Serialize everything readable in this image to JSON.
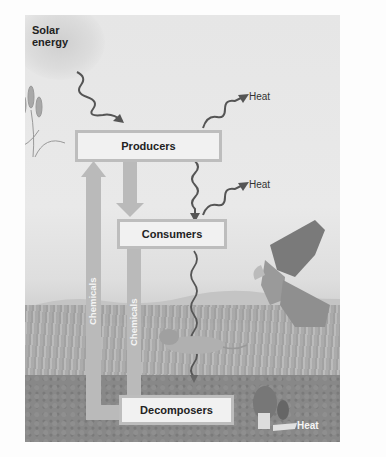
{
  "diagram": {
    "type": "ecosystem energy flow and chemical cycling",
    "labels": {
      "solar_energy": "Solar\nenergy",
      "solar_line1": "Solar",
      "solar_line2": "energy",
      "heat_top": "Heat",
      "heat_middle": "Heat",
      "heat_bottom": "Heat"
    },
    "boxes": {
      "producers": "Producers",
      "consumers": "Consumers",
      "decomposers": "Decomposers"
    },
    "chemical_arrows": {
      "left": "Chemicals",
      "middle": "Chemicals"
    },
    "illustrations": [
      "cattail-plant",
      "hawk",
      "mouse",
      "morel-mushroom",
      "grass",
      "soil"
    ],
    "colors": {
      "background": "#e6e6e6",
      "box_fill": "#f1f1f1",
      "box_border": "#bdbdbd",
      "chemical_arrow": "#b9b9b9",
      "energy_arrow": "#555555",
      "soil": "#888888"
    }
  }
}
